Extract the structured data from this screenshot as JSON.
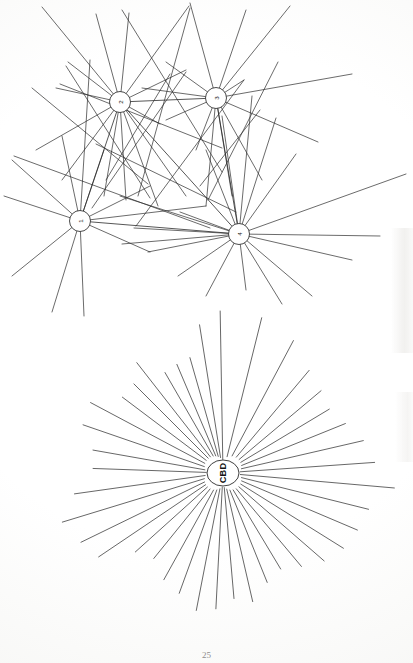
{
  "page": {
    "page_number": "25",
    "background_color": "#fefefe",
    "ink_color": "#2b2b2b"
  },
  "figures": [
    {
      "id": "top-network",
      "type": "node-link-network",
      "description": "Four-node interaction network with many radiating desire lines",
      "nodes": [
        {
          "id": "n1",
          "label": "1",
          "cx": 80,
          "cy": 221,
          "r": 10.5,
          "label_rotation": -90
        },
        {
          "id": "n2",
          "label": "2",
          "cx": 120,
          "cy": 102,
          "r": 10.5,
          "label_rotation": -90
        },
        {
          "id": "n3",
          "label": "3",
          "cx": 216,
          "cy": 98,
          "r": 10.5,
          "label_rotation": -90
        },
        {
          "id": "n4",
          "label": "4",
          "cx": 239,
          "cy": 234,
          "r": 10.5,
          "label_rotation": -90
        }
      ],
      "internal_links": [
        {
          "from": "n2",
          "to": "n3"
        },
        {
          "from": "n1",
          "to": "n4"
        },
        {
          "from": "n2",
          "to": "n4"
        },
        {
          "from": "n3",
          "to": "n4"
        },
        {
          "from": "n1",
          "to": "n2"
        }
      ],
      "node_spokes": {
        "n1": [
          [
            12,
            160
          ],
          [
            4,
            196
          ],
          [
            12,
            276
          ],
          [
            52,
            312
          ],
          [
            84,
            316
          ],
          [
            150,
            252
          ],
          [
            206,
            206
          ],
          [
            150,
            186
          ],
          [
            104,
            150
          ],
          [
            62,
            136
          ],
          [
            90,
            60
          ]
        ],
        "n2": [
          [
            42,
            7
          ],
          [
            96,
            14
          ],
          [
            129,
            13
          ],
          [
            189,
            6
          ],
          [
            68,
            62
          ],
          [
            62,
            180
          ],
          [
            104,
            196
          ],
          [
            126,
            200
          ],
          [
            158,
            206
          ],
          [
            186,
            196
          ],
          [
            36,
            150
          ],
          [
            56,
            88
          ],
          [
            186,
            70
          ],
          [
            160,
            124
          ]
        ],
        "n3": [
          [
            190,
            3
          ],
          [
            246,
            10
          ],
          [
            290,
            6
          ],
          [
            352,
            74
          ],
          [
            318,
            142
          ],
          [
            262,
            180
          ],
          [
            232,
            196
          ],
          [
            206,
            206
          ],
          [
            196,
            150
          ],
          [
            166,
            120
          ],
          [
            142,
            88
          ],
          [
            166,
            62
          ],
          [
            244,
            80
          ]
        ],
        "n4": [
          [
            406,
            174
          ],
          [
            380,
            236
          ],
          [
            352,
            260
          ],
          [
            312,
            296
          ],
          [
            282,
            304
          ],
          [
            246,
            290
          ],
          [
            206,
            296
          ],
          [
            178,
            276
          ],
          [
            148,
            252
          ],
          [
            122,
            244
          ],
          [
            134,
            228
          ],
          [
            180,
            212
          ],
          [
            206,
            150
          ],
          [
            222,
            116
          ],
          [
            252,
            96
          ],
          [
            276,
            118
          ],
          [
            296,
            154
          ],
          [
            120,
            196
          ]
        ]
      },
      "free_lines": [
        [
          122,
          10,
          222,
          172
        ],
        [
          66,
          66,
          150,
          198
        ],
        [
          190,
          8,
          138,
          196
        ],
        [
          14,
          156,
          210,
          228
        ],
        [
          186,
          72,
          92,
          208
        ],
        [
          200,
          186,
          260,
          110
        ],
        [
          278,
          62,
          208,
          200
        ],
        [
          96,
          144,
          236,
          212
        ],
        [
          170,
          74,
          106,
          180
        ],
        [
          244,
          80,
          136,
          226
        ],
        [
          32,
          88,
          148,
          184
        ],
        [
          60,
          84,
          222,
          148
        ]
      ]
    },
    {
      "id": "bottom-cbd-star",
      "type": "radial-star-hub",
      "description": "Radial CBD-focused desire-line diagram",
      "hub": {
        "label": "CBD",
        "cx": 223,
        "cy": 473,
        "rx": 16,
        "ry": 13,
        "label_rotation": -90
      },
      "ray_count": 40,
      "rays": [
        {
          "angle_deg": -91,
          "length": 162
        },
        {
          "angle_deg": -99,
          "length": 150
        },
        {
          "angle_deg": -106,
          "length": 120
        },
        {
          "angle_deg": -113,
          "length": 118
        },
        {
          "angle_deg": -120,
          "length": 116
        },
        {
          "angle_deg": -128,
          "length": 140
        },
        {
          "angle_deg": -135,
          "length": 126
        },
        {
          "angle_deg": -143,
          "length": 126
        },
        {
          "angle_deg": -152,
          "length": 150
        },
        {
          "angle_deg": -161,
          "length": 148
        },
        {
          "angle_deg": -170,
          "length": 132
        },
        {
          "angle_deg": -178,
          "length": 130
        },
        {
          "angle_deg": 172,
          "length": 150
        },
        {
          "angle_deg": 163,
          "length": 168
        },
        {
          "angle_deg": 154,
          "length": 158
        },
        {
          "angle_deg": 146,
          "length": 150
        },
        {
          "angle_deg": 138,
          "length": 118
        },
        {
          "angle_deg": 129,
          "length": 110
        },
        {
          "angle_deg": 119,
          "length": 122
        },
        {
          "angle_deg": 110,
          "length": 128
        },
        {
          "angle_deg": 101,
          "length": 140
        },
        {
          "angle_deg": 93,
          "length": 136
        },
        {
          "angle_deg": 85,
          "length": 126
        },
        {
          "angle_deg": 77,
          "length": 132
        },
        {
          "angle_deg": 68,
          "length": 118
        },
        {
          "angle_deg": 59,
          "length": 112
        },
        {
          "angle_deg": 50,
          "length": 122
        },
        {
          "angle_deg": 41,
          "length": 134
        },
        {
          "angle_deg": 32,
          "length": 142
        },
        {
          "angle_deg": 23,
          "length": 146
        },
        {
          "angle_deg": 14,
          "length": 150
        },
        {
          "angle_deg": 5,
          "length": 172
        },
        {
          "angle_deg": -4,
          "length": 152
        },
        {
          "angle_deg": -13,
          "length": 144
        },
        {
          "angle_deg": -22,
          "length": 132
        },
        {
          "angle_deg": -31,
          "length": 124
        },
        {
          "angle_deg": -40,
          "length": 128
        },
        {
          "angle_deg": -50,
          "length": 134
        },
        {
          "angle_deg": -62,
          "length": 150
        },
        {
          "angle_deg": -76,
          "length": 160
        }
      ]
    }
  ]
}
